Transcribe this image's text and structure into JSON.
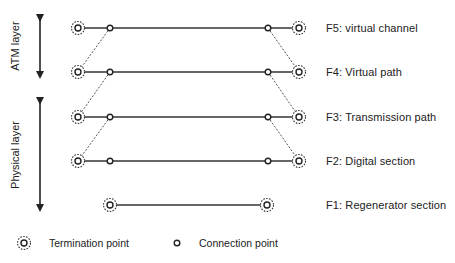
{
  "title": "",
  "layers": [
    {
      "label": "ATM layer",
      "arrow": {
        "x": 40,
        "y1": 14,
        "y2": 79
      },
      "label_pos": {
        "x": 15,
        "y": 46
      }
    },
    {
      "label": "Physical layer",
      "arrow": {
        "x": 40,
        "y1": 97,
        "y2": 212
      },
      "label_pos": {
        "x": 15,
        "y": 155
      }
    }
  ],
  "levels": [
    {
      "id": "F5",
      "label": "F5: virtual channel",
      "y": 28,
      "termination_points_x": [
        78,
        299
      ],
      "connection_points_x": [
        110,
        268
      ]
    },
    {
      "id": "F4",
      "label": "F4: Virtual path",
      "y": 72,
      "termination_points_x": [
        78,
        299
      ],
      "connection_points_x": [
        110,
        268
      ]
    },
    {
      "id": "F3",
      "label": "F3: Transmission path",
      "y": 117,
      "termination_points_x": [
        78,
        299
      ],
      "connection_points_x": [
        110,
        268
      ]
    },
    {
      "id": "F2",
      "label": "F2: Digital section",
      "y": 161,
      "termination_points_x": [
        78,
        299
      ],
      "connection_points_x": [
        110,
        268
      ]
    },
    {
      "id": "F1",
      "label": "F1: Regenerator section",
      "y": 205,
      "termination_points_x": [
        110,
        267
      ],
      "connection_points_x": []
    }
  ],
  "level_label_x": 326,
  "dashed_links": [
    {
      "from_level": "F5",
      "to_level": "F4",
      "side": "left"
    },
    {
      "from_level": "F4",
      "to_level": "F3",
      "side": "left"
    },
    {
      "from_level": "F3",
      "to_level": "F2",
      "side": "left"
    },
    {
      "from_level": "F5",
      "to_level": "F4",
      "side": "right"
    },
    {
      "from_level": "F4",
      "to_level": "F3",
      "side": "right"
    },
    {
      "from_level": "F3",
      "to_level": "F2",
      "side": "right"
    }
  ],
  "legend": {
    "y": 243,
    "items": [
      {
        "icon": "termination-point-icon",
        "icon_x": 24,
        "text": "Termination point",
        "text_x": 49
      },
      {
        "icon": "connection-point-icon",
        "icon_x": 177,
        "text": "Connection point",
        "text_x": 199
      }
    ]
  },
  "colors": {
    "line": "#333333",
    "dashed": "#555555",
    "text": "#222222"
  }
}
